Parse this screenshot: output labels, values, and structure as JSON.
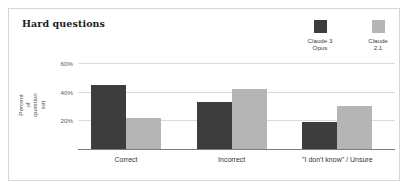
{
  "chart_data": {
    "type": "bar",
    "title": "Hard questions",
    "xlabel": "",
    "ylabel": "Percent of\nquestion set",
    "categories": [
      "Correct",
      "Incorrect",
      "\"I don't know\" / Unsure"
    ],
    "series": [
      {
        "name": "Claude 3\nOpus",
        "color": "#3d3d3d",
        "values": [
          45,
          33,
          19
        ]
      },
      {
        "name": "Claude\n2.1",
        "color": "#b5b5b5",
        "values": [
          21.5,
          42,
          30
        ]
      }
    ],
    "ylim": [
      0,
      60
    ],
    "yticks": [
      20,
      40,
      60
    ],
    "ytick_labels": [
      "20%",
      "40%",
      "60%"
    ],
    "grid": true,
    "legend_position": "top-right"
  },
  "legend": {
    "entries": [
      {
        "label": "Claude 3\nOpus",
        "color": "#3d3d3d"
      },
      {
        "label": "Claude\n2.1",
        "color": "#b5b5b5"
      }
    ]
  },
  "colors": {
    "frame": "#d6d6d6",
    "gridline": "#dcdcdc",
    "axis": "#7d7d7d",
    "background": "#ffffff",
    "series_dark": "#3d3d3d",
    "series_light": "#b5b5b5"
  }
}
